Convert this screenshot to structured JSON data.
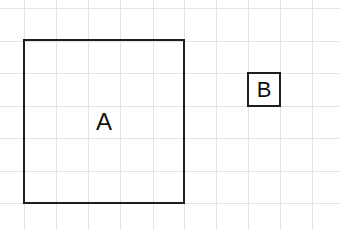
{
  "grid": {
    "line_color": "#e4e4e4",
    "cell_size": 32.3,
    "x_lines": [
      23.5,
      55.8,
      88.1,
      120.4,
      152.7,
      184,
      216,
      248,
      280,
      312
    ],
    "y_lines": [
      8,
      40.5,
      73,
      105.5,
      138,
      170.5,
      203
    ]
  },
  "shapes": [
    {
      "id": "A",
      "label": "A",
      "left": 23,
      "top": 39,
      "width": 162,
      "height": 165,
      "font_size": 24
    },
    {
      "id": "B",
      "label": "B",
      "left": 247,
      "top": 72,
      "width": 34,
      "height": 35,
      "font_size": 22
    }
  ],
  "colors": {
    "stroke": "#1e1e1e",
    "text": "#111111",
    "background": "#ffffff"
  }
}
